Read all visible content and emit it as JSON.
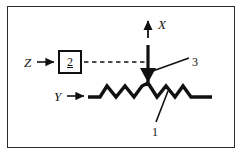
{
  "figure": {
    "type": "technical-line-diagram",
    "background_color": "#ffffff",
    "frame_color": "#2b2b2b",
    "stroke_color": "#111111",
    "labels": {
      "z": "Z",
      "y": "Y",
      "x": "X",
      "box_value": "2",
      "callout_3": "3",
      "callout_1": "1"
    },
    "icons": {
      "z_arrow": "right-arrow-icon",
      "y_arrow": "right-arrow-icon",
      "x_arrow": "up-arrow-icon",
      "beam_arrow": "down-arrow-icon",
      "dashed_link": "dashed-line-icon",
      "zigzag": "zigzag-surface-icon",
      "leader_3": "leader-line-icon",
      "leader_1": "leader-line-icon"
    }
  }
}
